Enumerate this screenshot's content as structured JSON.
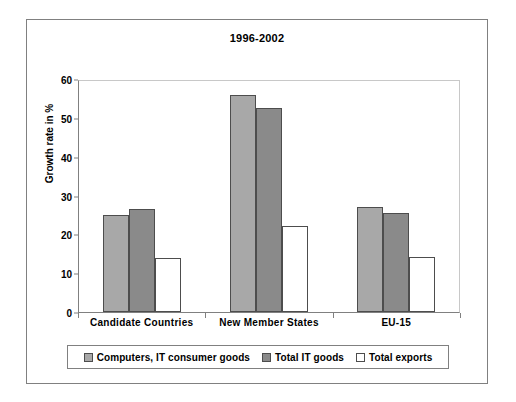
{
  "chart_data": {
    "type": "bar",
    "title": "1996-2002",
    "xlabel": "",
    "ylabel": "Growth rate in %",
    "ylim": [
      0,
      60
    ],
    "yticks": [
      0,
      10,
      20,
      30,
      40,
      50,
      60
    ],
    "grid": false,
    "legend_position": "bottom",
    "categories": [
      "Candidate Countries",
      "New Member States",
      "EU-15"
    ],
    "series": [
      {
        "name": "Computers, IT consumer goods",
        "color": "#a8a8a8",
        "values": [
          25.1,
          56.0,
          27.0
        ]
      },
      {
        "name": "Total IT goods",
        "color": "#8a8a8a",
        "values": [
          26.6,
          52.5,
          25.5
        ]
      },
      {
        "name": "Total exports",
        "color": "#ffffff",
        "values": [
          13.9,
          22.2,
          14.2
        ]
      }
    ]
  }
}
